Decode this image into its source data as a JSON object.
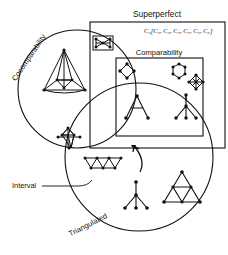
{
  "figure": {
    "type": "venn-euler-diagram",
    "background": "#ffffff",
    "stroke": "#111111"
  },
  "labels": {
    "superperfect": "Superperfect",
    "comparability": "Comparability",
    "cocomparability": "Cocomparability",
    "interval": "Interval",
    "triangulated": "Triangulated"
  },
  "notation": {
    "expression": "C₆[C₆, C₆, C₆, C₆, C₆, C₆]",
    "base": "C",
    "subscript": "6",
    "bracket_open": "[",
    "bracket_close": "]",
    "terms": [
      "C₆",
      "C₆",
      "C₆",
      "C₆",
      "C₆",
      "C₆"
    ],
    "term_count": 6
  },
  "regions": {
    "superperfect_rect": {
      "name": "Superperfect",
      "shape": "rectangle",
      "x": 90,
      "y": 22,
      "w": 135,
      "h": 126
    },
    "comparability_rect": {
      "name": "Comparability",
      "shape": "rectangle",
      "x": 116,
      "y": 58,
      "w": 87,
      "h": 78
    },
    "cocomparability_circle": {
      "name": "Cocomparability",
      "shape": "circle",
      "cx": 77,
      "cy": 89,
      "r": 59
    },
    "triangulated_circle": {
      "name": "Triangulated",
      "shape": "circle",
      "cx": 139,
      "cy": 157,
      "r": 74
    },
    "interval_region": {
      "name": "Interval",
      "shape": "lens-intersection"
    }
  },
  "graphs": [
    {
      "id": "bowtie",
      "name": "bowtie-graph",
      "region": "superperfect-only"
    },
    {
      "id": "nested-triangle",
      "name": "nested-triangle-graph",
      "region": "cocomparability-only"
    },
    {
      "id": "diamond-c4",
      "name": "c4-diamond-graph",
      "region": "comparability-cocomparability"
    },
    {
      "id": "hexagon",
      "name": "hexagon-graph",
      "region": "comparability-only"
    },
    {
      "id": "double-diamond",
      "name": "double-diamond-graph",
      "region": "comparability-only"
    },
    {
      "id": "tree-a",
      "name": "tree-a-graph",
      "region": "interval"
    },
    {
      "id": "spider-tree",
      "name": "spider-tree-graph",
      "region": "comparability-triangulated"
    },
    {
      "id": "vertical-kite",
      "name": "vertical-kite-graph",
      "region": "cocomparability-only"
    },
    {
      "id": "zigzag-path",
      "name": "zigzag-path-graph",
      "region": "cocomparability-triangulated"
    },
    {
      "id": "star-tree",
      "name": "star-tree-graph",
      "region": "triangulated-only"
    },
    {
      "id": "sun-triangle",
      "name": "sun-triangle-graph",
      "region": "triangulated-only"
    }
  ],
  "annotations": {
    "interval_leader": {
      "from": [
        66,
        186
      ],
      "to": [
        92,
        180
      ],
      "style": "line"
    },
    "interval_arrow": {
      "name": "curved-arrow",
      "points_to": "interval-region"
    }
  }
}
